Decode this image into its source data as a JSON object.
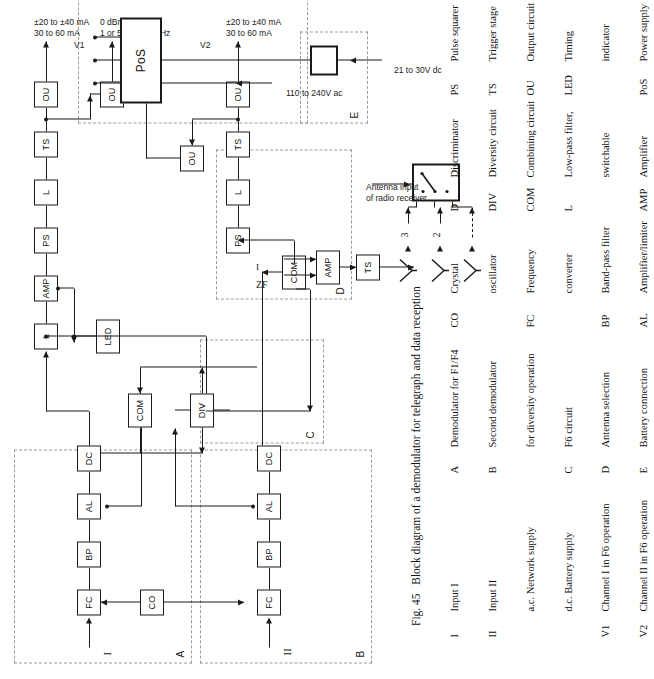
{
  "figure": {
    "number": "Fig. 45",
    "caption": "Block diagram of a demodulator for telegraph and data reception"
  },
  "signal_labels": {
    "ch1_current_line1": "30 to 60 mA",
    "ch1_current_line2": "±20 to ±40 mA",
    "ch1_tone_line1": "1 or 5kHz",
    "ch1_tone_line2": "0 dBm",
    "ch2_tone_line1": "1 or 5kHz",
    "ch2_tone_line2": "0 dBm",
    "ch2_current_line1": "30 to 60 mA",
    "ch2_current_line2": "±20 to ±40 mA",
    "v1": "V1",
    "v2": "V2",
    "input_1": "I",
    "input_2": "II",
    "antenna_input_line1": "Antenna input",
    "antenna_input_line2": "of radio receiver",
    "if_label": "ZF",
    "if_sub": "I",
    "ant_1": "1",
    "ant_2": "2",
    "ant_3": "3",
    "mains": "110 to 240V ac",
    "battery": "21 to 30V dc"
  },
  "group_labels": {
    "a": "A",
    "b": "B",
    "c": "C",
    "d": "D",
    "e": "E"
  },
  "blocks": {
    "ou": "OU",
    "ts": "TS",
    "l": "L",
    "ps": "PS",
    "com": "COM",
    "amp": "AMP",
    "led": "LED",
    "dc": "DC",
    "div": "DIV",
    "al": "AL",
    "bp": "BP",
    "fc": "FC",
    "co": "CO",
    "pos": "PoS"
  },
  "legend_sections": {
    "roman": [
      {
        "key": "I",
        "text": "Input I"
      },
      {
        "key": "II",
        "text": "Input II"
      },
      {
        "key": "",
        "text": "a.c. Network supply"
      },
      {
        "key": "",
        "text": "d.c. Battery supply"
      },
      {
        "key": "V1",
        "text": "Channel I in F6 operation"
      },
      {
        "key": "V2",
        "text": "Channel II in F6 operation"
      }
    ],
    "letters": [
      {
        "key": "A",
        "text": "Demodulator for F1/F4"
      },
      {
        "key": "B",
        "text": "Second demodulator"
      },
      {
        "key": "",
        "text": "for diversity operation"
      },
      {
        "key": "C",
        "text": "F6 circuit"
      },
      {
        "key": "D",
        "text": "Antenna selection"
      },
      {
        "key": "E",
        "text": "Battery connection"
      }
    ],
    "abbrev_left": [
      {
        "key": "CO",
        "text": "Crystal"
      },
      {
        "key": "",
        "text": "oscillator"
      },
      {
        "key": "FC",
        "text": "Frequency"
      },
      {
        "key": "",
        "text": "converter"
      },
      {
        "key": "BP",
        "text": "Band-pass filter"
      },
      {
        "key": "AL",
        "text": "Amplifier/limiter"
      }
    ],
    "abbrev_mid": [
      {
        "key": "D",
        "text": "Discriminator"
      },
      {
        "key": "DIV",
        "text": "Diversity circuit"
      },
      {
        "key": "COM",
        "text": "Combining circuit"
      },
      {
        "key": "L",
        "text": "Low-pass filter,"
      },
      {
        "key": "",
        "text": "switchable"
      },
      {
        "key": "AMP",
        "text": "Amplifier"
      }
    ],
    "abbrev_right": [
      {
        "key": "PS",
        "text": "Pulse squarer"
      },
      {
        "key": "TS",
        "text": "Trigger stage"
      },
      {
        "key": "OU",
        "text": "Output circuit"
      },
      {
        "key": "LED",
        "text": "Timing"
      },
      {
        "key": "",
        "text": "indicator"
      },
      {
        "key": "PoS",
        "text": "Power supply"
      }
    ]
  },
  "colors": {
    "ink": "#1a1a1a",
    "paper": "#ffffff",
    "group_dash": "#9a9a9a"
  }
}
